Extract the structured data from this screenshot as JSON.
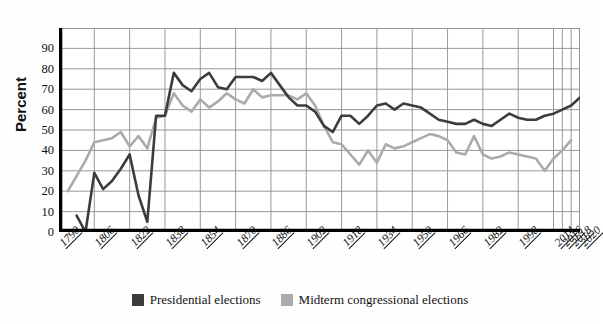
{
  "ghost_text": "",
  "axis": {
    "ylabel": "Percent",
    "yticks": [
      "90",
      "80",
      "70",
      "60",
      "50",
      "40",
      "30",
      "20",
      "10",
      "0"
    ]
  },
  "legend": {
    "items": [
      {
        "label": "Presidential elections",
        "color": "#3c3c3c"
      },
      {
        "label": "Midterm congressional elections",
        "color": "#ababab"
      }
    ]
  },
  "colors": {
    "presidential": "#3c3c3c",
    "midterm": "#ababab",
    "grid": "#8d8d8d",
    "axis": "#000000",
    "background": "#fefefe"
  },
  "chart_data": {
    "type": "line",
    "title": "",
    "xlabel": "",
    "ylabel": "Percent",
    "ylim": [
      0,
      100
    ],
    "yticks": [
      0,
      10,
      20,
      30,
      40,
      50,
      60,
      70,
      80,
      90
    ],
    "grid": true,
    "legend_position": "bottom",
    "tick_labels": [
      "1790",
      "1806",
      "1822",
      "1838",
      "1854",
      "1870",
      "1886",
      "1902",
      "1918",
      "1934",
      "1950",
      "1966",
      "1982",
      "1998",
      "2014",
      "2016",
      "2018",
      "2020"
    ],
    "x_index_of_tick": [
      0,
      4,
      8,
      12,
      16,
      20,
      24,
      28,
      32,
      36,
      40,
      44,
      48,
      52,
      56,
      57,
      58,
      59
    ],
    "series": [
      {
        "name": "Presidential elections",
        "color": "#3c3c3c",
        "points": [
          {
            "x": 2,
            "y": 8
          },
          {
            "x": 3,
            "y": 0
          },
          {
            "x": 4,
            "y": 29
          },
          {
            "x": 5,
            "y": 21
          },
          {
            "x": 6,
            "y": 25
          },
          {
            "x": 7,
            "y": 31
          },
          {
            "x": 8,
            "y": 38
          },
          {
            "x": 9,
            "y": 18
          },
          {
            "x": 10,
            "y": 5
          },
          {
            "x": 11,
            "y": 57
          },
          {
            "x": 12,
            "y": 57
          },
          {
            "x": 13,
            "y": 78
          },
          {
            "x": 14,
            "y": 72
          },
          {
            "x": 15,
            "y": 69
          },
          {
            "x": 16,
            "y": 75
          },
          {
            "x": 17,
            "y": 78
          },
          {
            "x": 18,
            "y": 71
          },
          {
            "x": 19,
            "y": 70
          },
          {
            "x": 20,
            "y": 76
          },
          {
            "x": 21,
            "y": 76
          },
          {
            "x": 22,
            "y": 76
          },
          {
            "x": 23,
            "y": 74
          },
          {
            "x": 24,
            "y": 78
          },
          {
            "x": 25,
            "y": 72
          },
          {
            "x": 26,
            "y": 66
          },
          {
            "x": 27,
            "y": 62
          },
          {
            "x": 28,
            "y": 62
          },
          {
            "x": 29,
            "y": 59
          },
          {
            "x": 30,
            "y": 52
          },
          {
            "x": 31,
            "y": 49
          },
          {
            "x": 32,
            "y": 57
          },
          {
            "x": 33,
            "y": 57
          },
          {
            "x": 34,
            "y": 53
          },
          {
            "x": 35,
            "y": 57
          },
          {
            "x": 36,
            "y": 62
          },
          {
            "x": 37,
            "y": 63
          },
          {
            "x": 38,
            "y": 60
          },
          {
            "x": 39,
            "y": 63
          },
          {
            "x": 40,
            "y": 62
          },
          {
            "x": 41,
            "y": 61
          },
          {
            "x": 42,
            "y": 58
          },
          {
            "x": 43,
            "y": 55
          },
          {
            "x": 44,
            "y": 54
          },
          {
            "x": 45,
            "y": 53
          },
          {
            "x": 46,
            "y": 53
          },
          {
            "x": 47,
            "y": 55
          },
          {
            "x": 48,
            "y": 53
          },
          {
            "x": 49,
            "y": 52
          },
          {
            "x": 50,
            "y": 55
          },
          {
            "x": 51,
            "y": 58
          },
          {
            "x": 52,
            "y": 56
          },
          {
            "x": 53,
            "y": 55
          },
          {
            "x": 54,
            "y": 55
          },
          {
            "x": 55,
            "y": 57
          },
          {
            "x": 56,
            "y": 58
          },
          {
            "x": 57,
            "y": 60
          },
          {
            "x": 58,
            "y": 62
          },
          {
            "x": 59,
            "y": 66
          }
        ]
      },
      {
        "name": "Midterm congressional elections",
        "color": "#ababab",
        "points": [
          {
            "x": 1,
            "y": 20
          },
          {
            "x": 3,
            "y": 35
          },
          {
            "x": 4,
            "y": 44
          },
          {
            "x": 5,
            "y": 45
          },
          {
            "x": 6,
            "y": 46
          },
          {
            "x": 7,
            "y": 49
          },
          {
            "x": 8,
            "y": 42
          },
          {
            "x": 9,
            "y": 47
          },
          {
            "x": 10,
            "y": 41
          },
          {
            "x": 11,
            "y": 56
          },
          {
            "x": 12,
            "y": 57
          },
          {
            "x": 13,
            "y": 68
          },
          {
            "x": 14,
            "y": 62
          },
          {
            "x": 15,
            "y": 59
          },
          {
            "x": 16,
            "y": 65
          },
          {
            "x": 17,
            "y": 61
          },
          {
            "x": 18,
            "y": 64
          },
          {
            "x": 19,
            "y": 68
          },
          {
            "x": 20,
            "y": 65
          },
          {
            "x": 21,
            "y": 63
          },
          {
            "x": 22,
            "y": 70
          },
          {
            "x": 23,
            "y": 66
          },
          {
            "x": 24,
            "y": 67
          },
          {
            "x": 25,
            "y": 67
          },
          {
            "x": 26,
            "y": 67
          },
          {
            "x": 27,
            "y": 65
          },
          {
            "x": 28,
            "y": 68
          },
          {
            "x": 29,
            "y": 62
          },
          {
            "x": 30,
            "y": 52
          },
          {
            "x": 31,
            "y": 44
          },
          {
            "x": 32,
            "y": 43
          },
          {
            "x": 33,
            "y": 38
          },
          {
            "x": 34,
            "y": 33
          },
          {
            "x": 35,
            "y": 40
          },
          {
            "x": 36,
            "y": 34
          },
          {
            "x": 37,
            "y": 43
          },
          {
            "x": 38,
            "y": 41
          },
          {
            "x": 39,
            "y": 42
          },
          {
            "x": 40,
            "y": 44
          },
          {
            "x": 41,
            "y": 46
          },
          {
            "x": 42,
            "y": 48
          },
          {
            "x": 43,
            "y": 47
          },
          {
            "x": 44,
            "y": 45
          },
          {
            "x": 45,
            "y": 39
          },
          {
            "x": 46,
            "y": 38
          },
          {
            "x": 47,
            "y": 47
          },
          {
            "x": 48,
            "y": 38
          },
          {
            "x": 49,
            "y": 36
          },
          {
            "x": 50,
            "y": 37
          },
          {
            "x": 51,
            "y": 39
          },
          {
            "x": 52,
            "y": 38
          },
          {
            "x": 53,
            "y": 37
          },
          {
            "x": 54,
            "y": 36
          },
          {
            "x": 55,
            "y": 30
          },
          {
            "x": 56,
            "y": 36
          },
          {
            "x": 57,
            "y": 40
          },
          {
            "x": 58,
            "y": 45
          }
        ]
      }
    ]
  }
}
